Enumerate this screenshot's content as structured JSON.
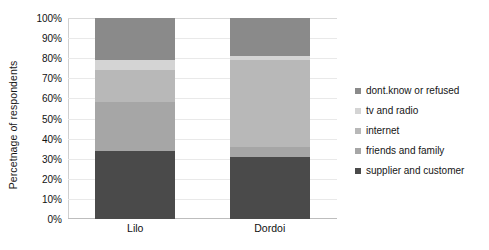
{
  "chart_data": {
    "type": "bar",
    "variant": "stacked-100",
    "title": "",
    "xlabel": "",
    "ylabel": "Percetnage of respondents",
    "categories": [
      "Lilo",
      "Dordoi"
    ],
    "ylim": [
      0,
      100
    ],
    "ytick_labels": [
      "0%",
      "10%",
      "20%",
      "30%",
      "40%",
      "50%",
      "60%",
      "70%",
      "80%",
      "90%",
      "100%"
    ],
    "ytick_values": [
      0,
      10,
      20,
      30,
      40,
      50,
      60,
      70,
      80,
      90,
      100
    ],
    "grid": true,
    "legend_position": "right",
    "legend_order": [
      "dont.know or refused",
      "tv and radio",
      "internet",
      "friends and family",
      "supplier and customer"
    ],
    "series": [
      {
        "name": "supplier and customer",
        "values": [
          34,
          31
        ],
        "color": "#4a4a4a"
      },
      {
        "name": "friends and family",
        "values": [
          24,
          5
        ],
        "color": "#a6a6a6"
      },
      {
        "name": "internet",
        "values": [
          16,
          43
        ],
        "color": "#b8b8b8"
      },
      {
        "name": "tv and radio",
        "values": [
          5,
          2
        ],
        "color": "#d4d4d4"
      },
      {
        "name": "dont.know or refused",
        "values": [
          21,
          19
        ],
        "color": "#8a8a8a"
      }
    ]
  },
  "legend": {
    "items": [
      {
        "label": "dont.know or refused",
        "color": "#8a8a8a"
      },
      {
        "label": "tv and radio",
        "color": "#d4d4d4"
      },
      {
        "label": "internet",
        "color": "#b8b8b8"
      },
      {
        "label": "friends and family",
        "color": "#a6a6a6"
      },
      {
        "label": "supplier and customer",
        "color": "#4a4a4a"
      }
    ]
  }
}
